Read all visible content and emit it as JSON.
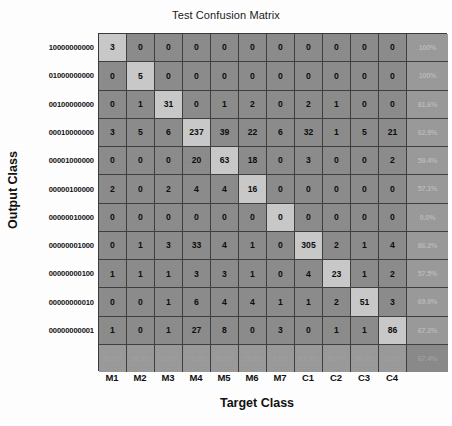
{
  "chart_data": {
    "type": "heatmap",
    "title": "Test Confusion Matrix",
    "xlabel": "Target Class",
    "ylabel": "Output Class",
    "categories": [
      "M1",
      "M2",
      "M3",
      "M4",
      "M5",
      "M6",
      "M7",
      "C1",
      "C2",
      "C3",
      "C4"
    ],
    "row_labels": [
      "10000000000",
      "01000000000",
      "00100000000",
      "00010000000",
      "00001000000",
      "00000100000",
      "00000010000",
      "00000001000",
      "00000000100",
      "00000000010",
      "00000000001"
    ],
    "matrix": [
      [
        3,
        0,
        0,
        0,
        0,
        0,
        0,
        0,
        0,
        0,
        0
      ],
      [
        0,
        5,
        0,
        0,
        0,
        0,
        0,
        0,
        0,
        0,
        0
      ],
      [
        0,
        1,
        31,
        0,
        1,
        2,
        0,
        2,
        1,
        0,
        0
      ],
      [
        3,
        5,
        6,
        237,
        39,
        22,
        6,
        32,
        1,
        5,
        21
      ],
      [
        0,
        0,
        0,
        20,
        63,
        18,
        0,
        3,
        0,
        0,
        2
      ],
      [
        2,
        0,
        2,
        4,
        4,
        16,
        0,
        0,
        0,
        0,
        0
      ],
      [
        0,
        0,
        0,
        0,
        0,
        0,
        0,
        0,
        0,
        0,
        0
      ],
      [
        0,
        1,
        3,
        33,
        4,
        1,
        0,
        305,
        2,
        1,
        4
      ],
      [
        1,
        1,
        1,
        3,
        3,
        1,
        0,
        4,
        23,
        1,
        2
      ],
      [
        0,
        0,
        1,
        6,
        4,
        4,
        1,
        1,
        2,
        51,
        3
      ],
      [
        1,
        0,
        1,
        27,
        8,
        0,
        3,
        0,
        1,
        1,
        86
      ]
    ],
    "row_percentages": [
      "100%",
      "100%",
      "81.6%",
      "62.9%",
      "59.4%",
      "57.1%",
      "0.0%",
      "86.2%",
      "57.5%",
      "69.9%",
      "67.2%"
    ],
    "column_percentages": [
      "30.0%",
      "38.5%",
      "63.9%",
      "71.6%",
      "50.0%",
      "25.0%",
      "0.0%",
      "87.9%",
      "76.7%",
      "86.4%",
      "72.9%"
    ],
    "overall_accuracy": "67.4%",
    "grid": true,
    "legend": "none",
    "colors": {
      "diagonal_cell": "#c9c9c9",
      "off_diagonal_cell": "#8c8c8c",
      "percent_cell": "#9a9a9a",
      "overall_cell": "#8a8a8a",
      "grid_line": "#3f3f3f",
      "count_text": "#0d0d0d",
      "percent_text": "#b9b9b9",
      "background": "#ffffff"
    }
  }
}
